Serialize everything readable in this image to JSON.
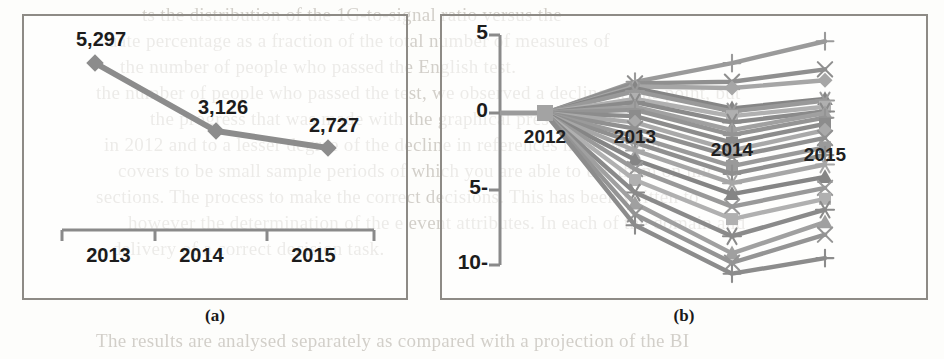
{
  "document": {
    "kind": "scanned-journal-page-figure",
    "background_text_lines": [
      "ts the distribution of the 1G-to-signal ratio versus the",
      "uate percentage as a fraction of  the total number of measures of",
      "the number of  people who passed the English test.",
      "the number of people who passed the test, we observed a decline at this point, but",
      "the progress that was made with the graphical presentations",
      "in  2012 and to a lesser degree  of the decline  in references made within",
      "covers to be small sample periods of which you are able to use them on mic",
      "sections. The process to make the correct decisions. This has been written to",
      "however the determination of the e  event attributes. In each of the domain and",
      "delivery of a correct decision task.",
      "The  results are analysed  separately as compared with a projection of the BI"
    ],
    "captions": {
      "a": "(a)",
      "b": "(b)"
    }
  },
  "chart_data": [
    {
      "panel": "a",
      "type": "line",
      "title": "",
      "xlabel": "",
      "ylabel": "",
      "categories": [
        "2013",
        "2014",
        "2015"
      ],
      "values": [
        5297,
        3126,
        2727
      ],
      "data_labels": [
        "5,297",
        "3,126",
        "2,727"
      ],
      "marker": "diamond",
      "series_color": "#8c8c8c",
      "grid": false,
      "y_axis_visible": false,
      "x_axis_visible": true,
      "legend": "none"
    },
    {
      "panel": "b",
      "type": "line",
      "title": "",
      "xlabel": "",
      "ylabel": "",
      "x": [
        "2012",
        "2013",
        "2014",
        "2015"
      ],
      "ytick_labels": [
        "5",
        "0",
        "5-",
        "10-"
      ],
      "ytick_values": [
        5,
        0,
        -5,
        -10
      ],
      "ylim": [
        -12,
        6
      ],
      "grid": false,
      "legend": "none",
      "series": [
        {
          "name": "s1",
          "marker": "plus",
          "values": [
            0,
            2.0,
            3.2,
            4.6
          ]
        },
        {
          "name": "s2",
          "marker": "cross",
          "values": [
            0,
            1.9,
            2.0,
            2.8
          ]
        },
        {
          "name": "s3",
          "marker": "diamond",
          "values": [
            0,
            1.7,
            1.6,
            2.1
          ]
        },
        {
          "name": "s4",
          "marker": "triangle",
          "values": [
            0,
            1.6,
            0.3,
            0.9
          ]
        },
        {
          "name": "s5",
          "marker": "asterisk",
          "values": [
            0,
            1.4,
            0.1,
            0.8
          ]
        },
        {
          "name": "s6",
          "marker": "square",
          "values": [
            0,
            0.9,
            -0.2,
            0.4
          ]
        },
        {
          "name": "s7",
          "marker": "asterisk",
          "values": [
            0,
            0.7,
            -0.6,
            0.1
          ]
        },
        {
          "name": "s8",
          "marker": "triangle",
          "values": [
            0,
            0.4,
            -1.1,
            0.0
          ]
        },
        {
          "name": "s9",
          "marker": "plus",
          "values": [
            0,
            0.2,
            -1.4,
            -0.3
          ]
        },
        {
          "name": "s10",
          "marker": "square",
          "values": [
            0,
            -0.2,
            -1.9,
            -0.7
          ]
        },
        {
          "name": "s11",
          "marker": "diamond",
          "values": [
            0,
            -0.6,
            -2.4,
            -1.1
          ]
        },
        {
          "name": "s12",
          "marker": "cross",
          "values": [
            0,
            -1.0,
            -2.8,
            -1.6
          ]
        },
        {
          "name": "s13",
          "marker": "square",
          "values": [
            0,
            -1.5,
            -3.4,
            -2.2
          ]
        },
        {
          "name": "s14",
          "marker": "plus",
          "values": [
            0,
            -1.9,
            -3.9,
            -2.7
          ]
        },
        {
          "name": "s15",
          "marker": "asterisk",
          "values": [
            0,
            -2.4,
            -4.5,
            -3.3
          ]
        },
        {
          "name": "s16",
          "marker": "triangle",
          "values": [
            0,
            -3.0,
            -5.2,
            -4.1
          ]
        },
        {
          "name": "s17",
          "marker": "cross",
          "values": [
            0,
            -3.6,
            -6.0,
            -4.8
          ]
        },
        {
          "name": "s18",
          "marker": "square",
          "values": [
            0,
            -4.3,
            -6.8,
            -5.5
          ]
        },
        {
          "name": "s19",
          "marker": "asterisk",
          "values": [
            0,
            -5.1,
            -7.9,
            -6.2
          ]
        },
        {
          "name": "s20",
          "marker": "triangle",
          "values": [
            0,
            -5.8,
            -9.0,
            -7.0
          ]
        },
        {
          "name": "s21",
          "marker": "cross",
          "values": [
            0,
            -6.5,
            -9.6,
            -7.8
          ]
        },
        {
          "name": "s22",
          "marker": "plus",
          "values": [
            0,
            -7.2,
            -10.3,
            -9.3
          ]
        }
      ]
    }
  ]
}
